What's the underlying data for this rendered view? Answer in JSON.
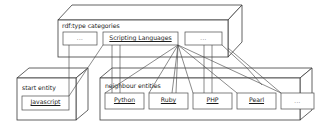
{
  "diagram": {
    "stroke_color": "#3b3b3b",
    "link_color": "#4c4c4c",
    "background": "#ffffff"
  },
  "categories_box": {
    "title": "rdf:type categories",
    "nodes": [
      {
        "label": "...",
        "kind": "ellipsis"
      },
      {
        "label": "Scripting Languages",
        "kind": "entity"
      },
      {
        "label": "...",
        "kind": "ellipsis"
      }
    ]
  },
  "start_entity_box": {
    "title": "start entity",
    "nodes": [
      {
        "label": "Javascript",
        "kind": "entity"
      }
    ]
  },
  "neighbour_entities_box": {
    "title": "neighbour entities",
    "nodes": [
      {
        "label": "Python",
        "kind": "entity"
      },
      {
        "label": "Ruby",
        "kind": "entity"
      },
      {
        "label": "PHP",
        "kind": "entity"
      },
      {
        "label": "Pearl",
        "kind": "entity"
      },
      {
        "label": "...",
        "kind": "ellipsis"
      }
    ]
  },
  "connections": [
    {
      "from": "Javascript",
      "to": "Scripting Languages"
    },
    {
      "from": "Javascript",
      "to": "categories-left-ellipsis"
    },
    {
      "from": "Scripting Languages",
      "to": "Python"
    },
    {
      "from": "Scripting Languages",
      "to": "Ruby"
    },
    {
      "from": "Scripting Languages",
      "to": "PHP"
    },
    {
      "from": "Scripting Languages",
      "to": "Pearl"
    },
    {
      "from": "Scripting Languages",
      "to": "neighbour-right-ellipsis"
    },
    {
      "from": "categories-right-ellipsis",
      "to": "Pearl"
    },
    {
      "from": "categories-right-ellipsis",
      "to": "neighbour-right-ellipsis"
    }
  ]
}
